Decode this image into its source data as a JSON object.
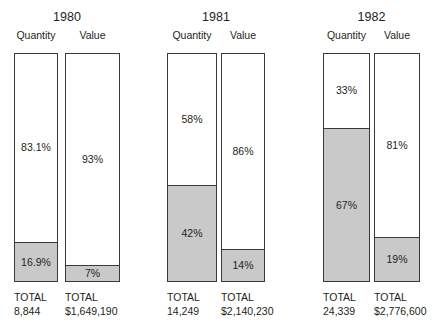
{
  "chart_data": {
    "type": "bar",
    "title": "",
    "subtitle": "",
    "xlabel": "",
    "ylabel": "",
    "grid": false,
    "legend_position": "none",
    "note": "100% stacked column pairs; white segment on top, shaded (gray) segment at bottom; each column labelled with the percentage of the visible segment(s) and a TOTAL beneath.",
    "axis_ranges": {
      "y": [
        0,
        100
      ]
    },
    "series": [
      {
        "name": "Top segment (white)",
        "color": "#ffffff"
      },
      {
        "name": "Bottom segment (shaded)",
        "color": "#c9c9c9"
      }
    ],
    "groups": [
      {
        "year": "1980",
        "columns": [
          {
            "header": "Quantity",
            "top_pct_label": "83.1%",
            "bottom_pct_label": "16.9%",
            "top_pct": 83.1,
            "bottom_pct": 16.9,
            "total_word": "TOTAL",
            "total_value": "8,844"
          },
          {
            "header": "Value",
            "top_pct_label": "93%",
            "bottom_pct_label": "7%",
            "top_pct": 93,
            "bottom_pct": 7,
            "total_word": "TOTAL",
            "total_value": "$1,649,190"
          }
        ]
      },
      {
        "year": "1981",
        "columns": [
          {
            "header": "Quantity",
            "top_pct_label": "58%",
            "bottom_pct_label": "42%",
            "top_pct": 58,
            "bottom_pct": 42,
            "total_word": "TOTAL",
            "total_value": "14,249"
          },
          {
            "header": "Value",
            "top_pct_label": "86%",
            "bottom_pct_label": "14%",
            "top_pct": 86,
            "bottom_pct": 14,
            "total_word": "TOTAL",
            "total_value": "$2,140,230"
          }
        ]
      },
      {
        "year": "1982",
        "columns": [
          {
            "header": "Quantity",
            "top_pct_label": "33%",
            "bottom_pct_label": "67%",
            "top_pct": 33,
            "bottom_pct": 67,
            "total_word": "TOTAL",
            "total_value": "24,339"
          },
          {
            "header": "Value",
            "top_pct_label": "81%",
            "bottom_pct_label": "19%",
            "top_pct": 81,
            "bottom_pct": 19,
            "total_word": "TOTAL",
            "total_value": "$2,776,600"
          }
        ]
      }
    ]
  },
  "colors": {
    "segment_shaded": "#c9c9c9",
    "segment_plain": "#ffffff",
    "outline": "#3a3a3a",
    "text": "#231f20",
    "background": "#ffffff"
  },
  "layout": {
    "bar_top": 53,
    "bar_bottom": 282,
    "columns_px": [
      {
        "left": 14,
        "width": 44
      },
      {
        "left": 65,
        "width": 55
      },
      {
        "left": 167,
        "width": 50
      },
      {
        "left": 221,
        "width": 44
      },
      {
        "left": 323,
        "width": 47
      },
      {
        "left": 374,
        "width": 46
      }
    ]
  }
}
